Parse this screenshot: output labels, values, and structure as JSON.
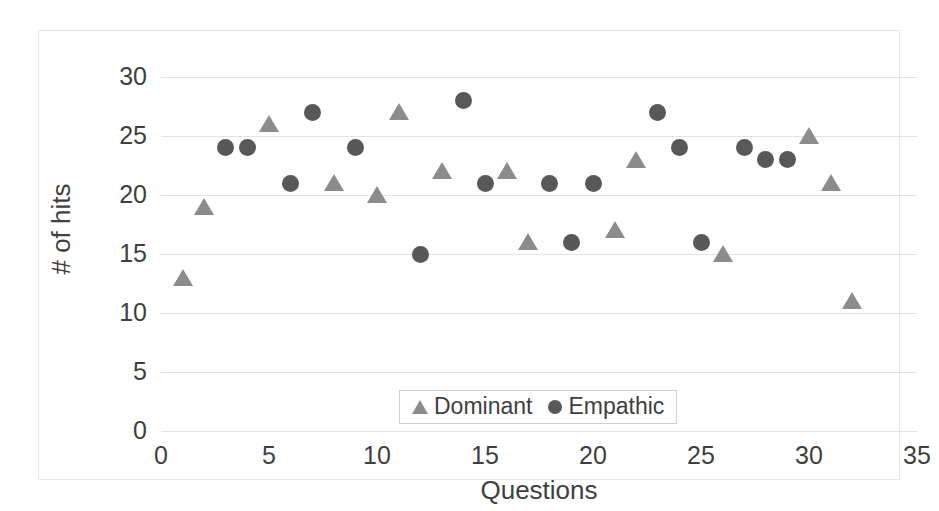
{
  "chart_data": {
    "type": "scatter",
    "title": "",
    "xlabel": "Questions",
    "ylabel": "# of hits",
    "xlim": [
      0,
      35
    ],
    "ylim": [
      0,
      30
    ],
    "xticks": [
      0,
      5,
      10,
      15,
      20,
      25,
      30,
      35
    ],
    "yticks": [
      0,
      5,
      10,
      15,
      20,
      25,
      30
    ],
    "grid": "horizontal",
    "legend_position": "inside-bottom-center",
    "series": [
      {
        "name": "Dominant",
        "marker": "triangle",
        "color": "#8c8c8c",
        "points": [
          {
            "x": 1,
            "y": 13
          },
          {
            "x": 2,
            "y": 19
          },
          {
            "x": 5,
            "y": 26
          },
          {
            "x": 8,
            "y": 21
          },
          {
            "x": 10,
            "y": 20
          },
          {
            "x": 11,
            "y": 27
          },
          {
            "x": 13,
            "y": 22
          },
          {
            "x": 16,
            "y": 22
          },
          {
            "x": 17,
            "y": 16
          },
          {
            "x": 21,
            "y": 17
          },
          {
            "x": 22,
            "y": 23
          },
          {
            "x": 26,
            "y": 15
          },
          {
            "x": 30,
            "y": 25
          },
          {
            "x": 31,
            "y": 21
          },
          {
            "x": 32,
            "y": 11
          }
        ]
      },
      {
        "name": "Empathic",
        "marker": "circle",
        "color": "#585858",
        "points": [
          {
            "x": 3,
            "y": 24
          },
          {
            "x": 4,
            "y": 24
          },
          {
            "x": 6,
            "y": 21
          },
          {
            "x": 7,
            "y": 27
          },
          {
            "x": 9,
            "y": 24
          },
          {
            "x": 12,
            "y": 15
          },
          {
            "x": 14,
            "y": 28
          },
          {
            "x": 15,
            "y": 21
          },
          {
            "x": 18,
            "y": 21
          },
          {
            "x": 19,
            "y": 16
          },
          {
            "x": 20,
            "y": 21
          },
          {
            "x": 23,
            "y": 27
          },
          {
            "x": 24,
            "y": 24
          },
          {
            "x": 25,
            "y": 16
          },
          {
            "x": 27,
            "y": 24
          },
          {
            "x": 28,
            "y": 23
          },
          {
            "x": 29,
            "y": 23
          }
        ]
      }
    ]
  },
  "legend": {
    "entries": [
      {
        "label": "Dominant",
        "marker": "triangle"
      },
      {
        "label": "Empathic",
        "marker": "circle"
      }
    ]
  },
  "axes": {
    "x_title": "Questions",
    "y_title": "# of hits"
  }
}
